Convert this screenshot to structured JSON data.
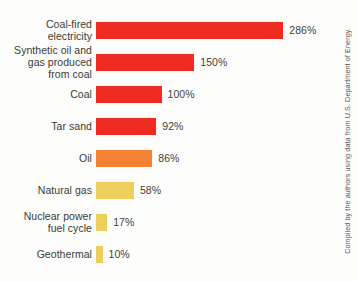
{
  "chart_data": {
    "type": "bar",
    "orientation": "horizontal",
    "title": "",
    "subtitle": "",
    "xlabel": "",
    "ylabel": "",
    "grid": false,
    "legend": "none",
    "xlim": [
      0,
      286
    ],
    "unit": "%",
    "categories": [
      "Coal-fired\nelectricity",
      "Synthetic oil and\ngas produced\nfrom coal",
      "Coal",
      "Tar sand",
      "Oil",
      "Natural gas",
      "Nuclear power\nfuel cycle",
      "Geothermal"
    ],
    "values": [
      286,
      150,
      100,
      92,
      86,
      58,
      17,
      10
    ],
    "value_labels": [
      "286%",
      "150%",
      "100%",
      "92%",
      "86%",
      "58%",
      "17%",
      "10%"
    ],
    "bar_colors": [
      "#ee2c20",
      "#ee2c20",
      "#ee2c20",
      "#ee2c20",
      "#f58232",
      "#eccf5c",
      "#eccf5c",
      "#eccf5c"
    ],
    "annotations": [
      "Compiled by the authors using data from U.S. Department of Energy."
    ]
  },
  "credit": {
    "text": "Compiled by the authors using data from U.S. Department of Energy."
  },
  "colors": {
    "red": "#ee2c20",
    "orange": "#f58232",
    "yellow": "#eccf5c",
    "background": "#fdfdfb",
    "text": "#3a3a38"
  }
}
